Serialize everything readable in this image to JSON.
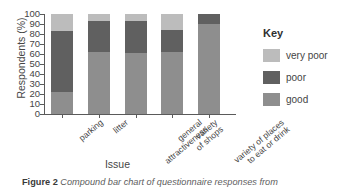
{
  "chart_data": {
    "type": "bar",
    "stacked": true,
    "title": "",
    "xlabel": "Issue",
    "ylabel": "Respondents (%)",
    "ylim": [
      0,
      100
    ],
    "ytick_step": 10,
    "yticks": [
      100,
      90,
      80,
      70,
      60,
      50,
      40,
      30,
      20,
      10,
      0
    ],
    "grid": false,
    "legend_title": "Key",
    "legend_position": "right",
    "categories": [
      "parking",
      "litter",
      "general attractiveness",
      "variety of shops",
      "variety of places to eat or drink"
    ],
    "category_lines": [
      [
        "parking"
      ],
      [
        "litter"
      ],
      [
        "general",
        "attractiveness"
      ],
      [
        "variety",
        "of shops"
      ],
      [
        "variety of places",
        "to eat or drink"
      ]
    ],
    "series": [
      {
        "name": "good",
        "color": "#8e8e8e",
        "values": [
          22,
          62,
          61,
          62,
          90
        ]
      },
      {
        "name": "poor",
        "color": "#606060",
        "values": [
          61,
          31,
          32,
          22,
          10
        ]
      },
      {
        "name": "very poor",
        "color": "#bcbcbc",
        "values": [
          17,
          7,
          7,
          16,
          0
        ]
      }
    ],
    "cumulative_tops": [
      [
        22,
        83,
        100
      ],
      [
        62,
        93,
        100
      ],
      [
        61,
        93,
        100
      ],
      [
        62,
        84,
        100
      ],
      [
        90,
        100,
        100
      ]
    ]
  },
  "axes": {
    "y_title": "Respondents (%)",
    "x_title": "Issue"
  },
  "legend": {
    "title": "Key",
    "items": [
      {
        "label": "very poor",
        "color": "#bcbcbc"
      },
      {
        "label": "poor",
        "color": "#606060"
      },
      {
        "label": "good",
        "color": "#8e8e8e"
      }
    ]
  },
  "caption": {
    "figure_number": "Figure 2",
    "text": "Compound bar chart of questionnaire responses from"
  }
}
